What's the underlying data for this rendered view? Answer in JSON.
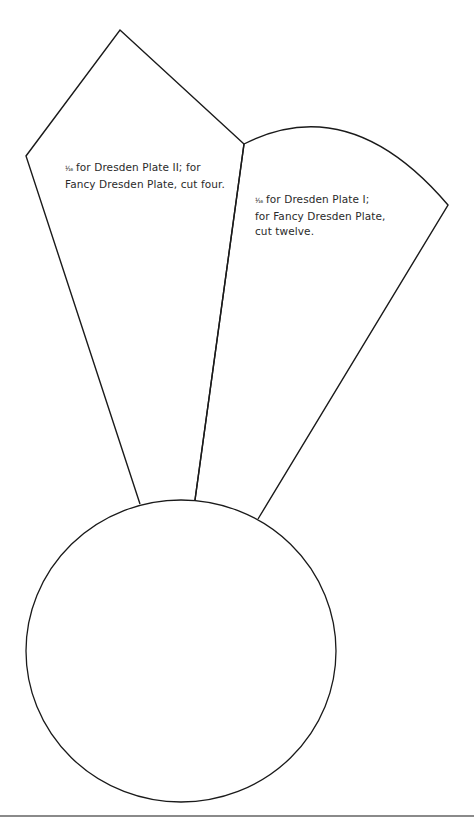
{
  "template_pieces": [
    {
      "id": "dresden-plate-ii-wedge",
      "shape": "pointed wedge",
      "label_fraction": "1/16",
      "label_fraction_display": "¹⁄₁₆",
      "label_line1": "for Dresden Plate II; for",
      "label_line2": "Fancy Dresden Plate, cut four."
    },
    {
      "id": "dresden-plate-i-wedge",
      "shape": "rounded wedge",
      "label_fraction": "1/16",
      "label_fraction_display": "¹⁄₁₆",
      "label_line1": "for Dresden Plate I;",
      "label_line2": "for Fancy Dresden Plate,",
      "label_line3": "cut twelve."
    },
    {
      "id": "center-circle",
      "shape": "circle"
    }
  ],
  "colors": {
    "stroke": "#1a1a1a",
    "background": "#ffffff",
    "text": "#2a2a2a",
    "rule": "#8a8a8a"
  }
}
